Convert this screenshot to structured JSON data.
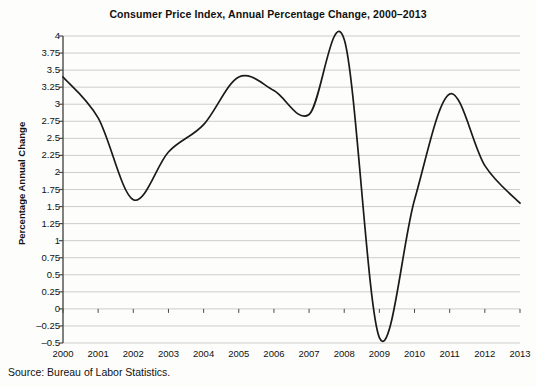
{
  "chart_data": {
    "type": "line",
    "title": "Consumer Price Index, Annual Percentage Change, 2000–2013",
    "xlabel": "",
    "ylabel": "Percentage Annual Change",
    "source": "Source: Bureau of Labor Statistics.",
    "x": [
      2000,
      2001,
      2002,
      2003,
      2004,
      2005,
      2006,
      2007,
      2008,
      2009,
      2010,
      2011,
      2012,
      2013
    ],
    "values": [
      3.4,
      2.8,
      1.6,
      2.3,
      2.7,
      3.4,
      3.2,
      2.85,
      3.95,
      -0.42,
      1.6,
      3.15,
      2.1,
      1.55
    ],
    "series": [
      {
        "name": "Consumer Price Index annual percentage change",
        "values": [
          3.4,
          2.8,
          1.6,
          2.3,
          2.7,
          3.4,
          3.2,
          2.85,
          3.95,
          -0.42,
          1.6,
          3.15,
          2.1,
          1.55
        ]
      }
    ],
    "xtick_labels": [
      "2000",
      "2001",
      "2002",
      "2003",
      "2004",
      "2005",
      "2006",
      "2007",
      "2008",
      "2009",
      "2010",
      "2011",
      "2012",
      "2013"
    ],
    "ytick_labels": [
      "4",
      "3.75",
      "3.5",
      "3.25",
      "3",
      "2.75",
      "2.5",
      "2.25",
      "2",
      "1.75",
      "1.5",
      "1.25",
      "1",
      "0.75",
      "0.5",
      "0.25",
      "0",
      "–0.25",
      "–0.5"
    ],
    "ytick_values": [
      4,
      3.75,
      3.5,
      3.25,
      3,
      2.75,
      2.5,
      2.25,
      2,
      1.75,
      1.5,
      1.25,
      1,
      0.75,
      0.5,
      0.25,
      0,
      -0.25,
      -0.5
    ],
    "ylim": [
      -0.5,
      4
    ],
    "xlim": [
      2000,
      2013
    ],
    "grid": true,
    "legend": false,
    "line_color": "#1a1a1a",
    "grid_color": "#b8b8b8",
    "axis_color": "#4a4a4a"
  }
}
